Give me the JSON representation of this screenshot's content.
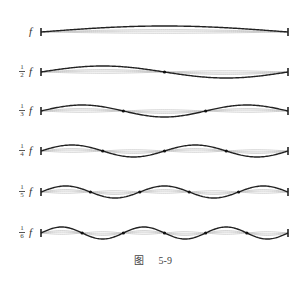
{
  "figure": {
    "caption_prefix": "图",
    "caption_number": "5-9",
    "rows": [
      {
        "label_whole": "f",
        "fraction": null,
        "segments": 1,
        "y": 32
      },
      {
        "label_whole": "f",
        "fraction": {
          "num": "1",
          "den": "2"
        },
        "segments": 2,
        "y": 72
      },
      {
        "label_whole": "f",
        "fraction": {
          "num": "1",
          "den": "3"
        },
        "segments": 3,
        "y": 111
      },
      {
        "label_whole": "f",
        "fraction": {
          "num": "1",
          "den": "4"
        },
        "segments": 4,
        "y": 151
      },
      {
        "label_whole": "f",
        "fraction": {
          "num": "1",
          "den": "5"
        },
        "segments": 5,
        "y": 192
      },
      {
        "label_whole": "f",
        "fraction": {
          "num": "1",
          "den": "6"
        },
        "segments": 6,
        "y": 233
      }
    ],
    "string_left_x": 41,
    "string_right_x": 288,
    "colors": {
      "wave": "#222222",
      "ghost": "#bbbbbb",
      "node": "#111111"
    }
  }
}
